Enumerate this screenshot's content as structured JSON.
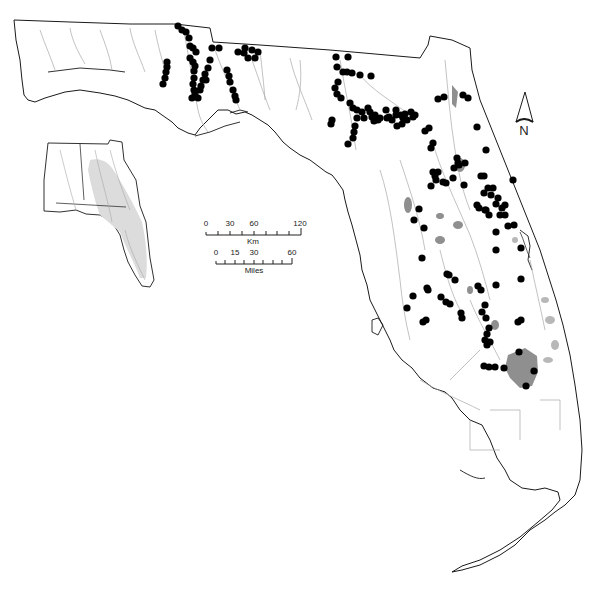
{
  "map": {
    "colors": {
      "background": "#ffffff",
      "outline": "#1a1a1a",
      "rivers": "#9a9a9a",
      "lakes": "#8f8f8f",
      "inset_fill": "#dcdcdc",
      "points": "#000000"
    },
    "north_arrow": {
      "label": "N",
      "icon": "north-arrow-icon"
    },
    "scale_km": {
      "unit": "Km",
      "ticks": [
        "0",
        "30",
        "60",
        "120"
      ]
    },
    "scale_miles": {
      "unit": "Miles",
      "ticks": [
        "0",
        "15",
        "30",
        "60"
      ]
    },
    "inset": {
      "description": "Alabama/Georgia/Florida drainage basin inset with shaded watershed"
    },
    "points": [
      [
        178,
        26
      ],
      [
        182,
        30
      ],
      [
        186,
        32
      ],
      [
        189,
        38
      ],
      [
        190,
        46
      ],
      [
        193,
        48
      ],
      [
        196,
        52
      ],
      [
        190,
        58
      ],
      [
        193,
        62
      ],
      [
        195,
        66
      ],
      [
        194,
        71
      ],
      [
        194,
        78
      ],
      [
        193,
        84
      ],
      [
        194,
        90
      ],
      [
        195,
        94
      ],
      [
        192,
        98
      ],
      [
        198,
        98
      ],
      [
        200,
        90
      ],
      [
        201,
        86
      ],
      [
        203,
        80
      ],
      [
        205,
        74
      ],
      [
        208,
        68
      ],
      [
        210,
        60
      ],
      [
        212,
        48
      ],
      [
        219,
        48
      ],
      [
        167,
        62
      ],
      [
        167,
        67
      ],
      [
        166,
        72
      ],
      [
        165,
        78
      ],
      [
        163,
        84
      ],
      [
        206,
        80
      ],
      [
        227,
        70
      ],
      [
        229,
        76
      ],
      [
        230,
        82
      ],
      [
        233,
        90
      ],
      [
        235,
        96
      ],
      [
        236,
        100
      ],
      [
        238,
        52
      ],
      [
        244,
        53
      ],
      [
        245,
        48
      ],
      [
        248,
        58
      ],
      [
        252,
        50
      ],
      [
        258,
        52
      ],
      [
        255,
        58
      ],
      [
        336,
        57
      ],
      [
        348,
        57
      ],
      [
        337,
        67
      ],
      [
        343,
        72
      ],
      [
        347,
        72
      ],
      [
        352,
        73
      ],
      [
        360,
        75
      ],
      [
        371,
        76
      ],
      [
        338,
        82
      ],
      [
        335,
        88
      ],
      [
        337,
        94
      ],
      [
        341,
        98
      ],
      [
        350,
        103
      ],
      [
        353,
        108
      ],
      [
        357,
        110
      ],
      [
        362,
        112
      ],
      [
        364,
        118
      ],
      [
        368,
        108
      ],
      [
        370,
        112
      ],
      [
        372,
        117
      ],
      [
        374,
        121
      ],
      [
        375,
        115
      ],
      [
        378,
        120
      ],
      [
        380,
        118
      ],
      [
        386,
        110
      ],
      [
        387,
        118
      ],
      [
        389,
        117
      ],
      [
        392,
        120
      ],
      [
        396,
        115
      ],
      [
        396,
        110
      ],
      [
        401,
        115
      ],
      [
        403,
        118
      ],
      [
        405,
        114
      ],
      [
        407,
        120
      ],
      [
        411,
        112
      ],
      [
        413,
        117
      ],
      [
        415,
        115
      ],
      [
        402,
        124
      ],
      [
        397,
        126
      ],
      [
        357,
        118
      ],
      [
        355,
        126
      ],
      [
        354,
        132
      ],
      [
        353,
        138
      ],
      [
        331,
        124
      ],
      [
        332,
        120
      ],
      [
        348,
        144
      ],
      [
        425,
        131
      ],
      [
        429,
        128
      ],
      [
        433,
        143
      ],
      [
        431,
        148
      ],
      [
        444,
        97
      ],
      [
        438,
        99
      ],
      [
        463,
        95
      ],
      [
        468,
        98
      ],
      [
        457,
        158
      ],
      [
        458,
        163
      ],
      [
        465,
        163
      ],
      [
        477,
        127
      ],
      [
        464,
        185
      ],
      [
        486,
        150
      ],
      [
        433,
        172
      ],
      [
        435,
        176
      ],
      [
        436,
        180
      ],
      [
        438,
        172
      ],
      [
        431,
        186
      ],
      [
        443,
        182
      ],
      [
        446,
        183
      ],
      [
        453,
        178
      ],
      [
        454,
        168
      ],
      [
        459,
        165
      ],
      [
        481,
        176
      ],
      [
        484,
        176
      ],
      [
        488,
        188
      ],
      [
        484,
        193
      ],
      [
        477,
        205
      ],
      [
        479,
        208
      ],
      [
        493,
        188
      ],
      [
        491,
        195
      ],
      [
        486,
        210
      ],
      [
        498,
        198
      ],
      [
        496,
        204
      ],
      [
        502,
        208
      ],
      [
        505,
        205
      ],
      [
        500,
        215
      ],
      [
        505,
        215
      ],
      [
        489,
        215
      ],
      [
        485,
        210
      ],
      [
        513,
        180
      ],
      [
        514,
        225
      ],
      [
        508,
        226
      ],
      [
        496,
        232
      ],
      [
        521,
        248
      ],
      [
        496,
        250
      ],
      [
        521,
        279
      ],
      [
        419,
        209
      ],
      [
        424,
        228
      ],
      [
        414,
        220
      ],
      [
        422,
        258
      ],
      [
        427,
        288
      ],
      [
        428,
        290
      ],
      [
        413,
        296
      ],
      [
        407,
        308
      ],
      [
        423,
        322
      ],
      [
        441,
        297
      ],
      [
        446,
        302
      ],
      [
        455,
        280
      ],
      [
        449,
        275
      ],
      [
        450,
        304
      ],
      [
        447,
        274
      ],
      [
        478,
        286
      ],
      [
        481,
        290
      ],
      [
        485,
        305
      ],
      [
        482,
        312
      ],
      [
        486,
        318
      ],
      [
        489,
        328
      ],
      [
        461,
        313
      ],
      [
        462,
        318
      ],
      [
        496,
        285
      ],
      [
        487,
        334
      ],
      [
        485,
        340
      ],
      [
        487,
        345
      ],
      [
        490,
        342
      ],
      [
        518,
        322
      ],
      [
        521,
        320
      ],
      [
        426,
        320
      ],
      [
        484,
        366
      ],
      [
        489,
        367
      ],
      [
        495,
        367
      ],
      [
        504,
        368
      ],
      [
        519,
        352
      ],
      [
        534,
        371
      ],
      [
        526,
        386
      ]
    ]
  }
}
